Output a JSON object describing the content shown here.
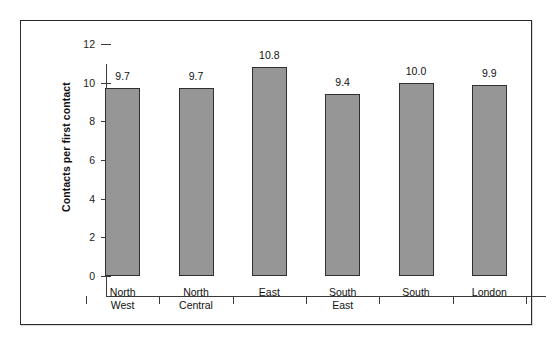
{
  "chart_data": {
    "type": "bar",
    "title": "",
    "xlabel": "",
    "ylabel": "Contacts per first contact",
    "categories": [
      "North\nWest",
      "North\nCentral",
      "East",
      "South\nEast",
      "South",
      "London"
    ],
    "values": [
      9.7,
      9.7,
      10.8,
      9.4,
      10.0,
      9.9
    ],
    "value_labels": [
      "9.7",
      "9.7",
      "10.8",
      "9.4",
      "10.0",
      "9.9"
    ],
    "ylim": [
      0,
      12
    ],
    "yticks": [
      0,
      2,
      4,
      6,
      8,
      10,
      12
    ],
    "ytick_labels": [
      "0",
      "2",
      "4",
      "6",
      "8",
      "10",
      "12"
    ],
    "grid": false,
    "legend": null,
    "bar_color": "#969696",
    "bar_edge_color": "#303030",
    "axis_color": "#3a3a3a",
    "text_color": "#111111",
    "background": "#ffffff",
    "frame_color": "#2b2b2b"
  }
}
